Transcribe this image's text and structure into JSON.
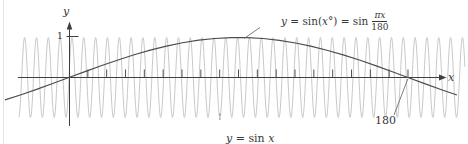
{
  "colors": {
    "background": "#ffffff",
    "axis": "#3f3f3f",
    "text": "#383838",
    "sin_x_curve": "#c5c5c5",
    "sin_degrees_curve": "#4c4c4c",
    "leader": "#6e6e6e",
    "page_edge": "#e3e3e3"
  },
  "labels": {
    "y_axis": "y",
    "x_axis": "x",
    "one_tick": "1",
    "top_function": {
      "p1": "y",
      "p2": " = sin(",
      "p3": "x",
      "p4": "°) = sin",
      "num": "πx",
      "den": "180"
    },
    "bottom_function": {
      "p1": "y",
      "p2": " = sin ",
      "p3": "x"
    },
    "intercept": "180"
  },
  "chart_data": {
    "type": "line",
    "title": "",
    "xlabel": "x",
    "ylabel": "y",
    "grid": false,
    "legend_position": "curve labels with leader lines",
    "x_axis": {
      "tick_step": 10,
      "tick_first": 10,
      "tick_last": 180,
      "visible_range": [
        -36,
        200
      ]
    },
    "y_axis": {
      "tick_labels": [
        "1"
      ],
      "range": [
        -1.3,
        1.35
      ]
    },
    "functions": [
      {
        "name": "y = sin x",
        "formula": "sin(x) (x in radians)",
        "period": 6.2831853,
        "amplitude": 1,
        "x_min": -26.6,
        "x_max": 210.3,
        "color": "#c5c5c5"
      },
      {
        "name": "y = sin(x°) = sin(πx/180)",
        "formula": "sin(πx/180)",
        "period": 360,
        "amplitude": 1,
        "x_min": -34,
        "x_max": 208.7,
        "color": "#4c4c4c"
      }
    ],
    "key_points": {
      "sin_degrees_x_intercepts": [
        0,
        180
      ],
      "sin_degrees_peak_x": 90,
      "amplitude": 1
    },
    "annotations": [
      {
        "text": "y = sin(x°) = sin πx/180",
        "points_to": "slow curve near its peak"
      },
      {
        "text": "y = sin x",
        "points_to": "fast oscillating curve"
      },
      {
        "text": "180",
        "points_to": "x-intercept of sin(x°)"
      }
    ]
  }
}
